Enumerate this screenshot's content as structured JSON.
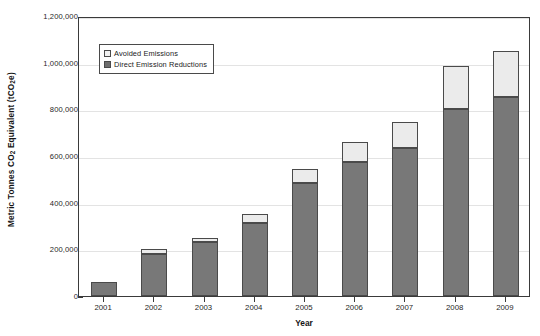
{
  "chart_data": {
    "type": "bar",
    "subtype": "stacked",
    "title": "",
    "xlabel": "Year",
    "ylabel": "Metric Tonnes CO2 Equivalent (tCO2e)",
    "categories": [
      "2001",
      "2002",
      "2003",
      "2004",
      "2005",
      "2006",
      "2007",
      "2008",
      "2009"
    ],
    "series": [
      {
        "name": "Direct Emission Reductions",
        "color": "#787878",
        "values": [
          60000,
          180000,
          230000,
          315000,
          485000,
          575000,
          635000,
          800000,
          855000
        ]
      },
      {
        "name": "Avoided Emissions",
        "color": "#ebebeb",
        "values": [
          0,
          20000,
          20000,
          35000,
          60000,
          85000,
          110000,
          185000,
          195000
        ]
      }
    ],
    "totals": [
      60000,
      200000,
      250000,
      350000,
      545000,
      660000,
      745000,
      985000,
      1050000
    ],
    "ylim": [
      0,
      1200000
    ],
    "ytick_values": [
      0,
      200000,
      400000,
      600000,
      800000,
      1000000,
      1200000
    ],
    "ytick_labels": [
      "0",
      "200,000",
      "400,000",
      "600,000",
      "800,000",
      "1,000,000",
      "1,200,000"
    ],
    "grid": true,
    "legend_position": "upper-left-inside",
    "legend_entries": [
      "Avoided Emissions",
      "Direct Emission Reductions"
    ]
  },
  "axes": {
    "y_title_pre": "Metric Tonnes CO",
    "y_title_sub": "2",
    "y_title_mid": " Equivalent (tCO",
    "y_title_sub2": "2",
    "y_title_post": "e)",
    "x_title": "Year"
  },
  "legend": {
    "avoided_label": "Avoided Emissions",
    "direct_label": "Direct Emission Reductions"
  },
  "colors": {
    "direct": "#787878",
    "avoided": "#ebebeb",
    "axis": "#3a3a3a",
    "grid": "#e3e3e3",
    "text": "#1a1a1a"
  }
}
